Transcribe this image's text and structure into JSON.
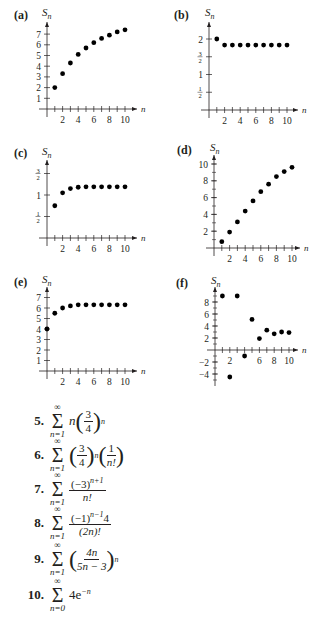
{
  "chart_data": [
    {
      "id": "a",
      "label": "(a)",
      "type": "scatter",
      "ylabel": "S_n",
      "xlabel": "n",
      "x": [
        1,
        2,
        3,
        4,
        5,
        6,
        7,
        8,
        9,
        10
      ],
      "values": [
        2,
        3.3,
        4.3,
        5.1,
        5.7,
        6.2,
        6.6,
        6.9,
        7.2,
        7.4
      ],
      "xticks": [
        "2",
        "4",
        "6",
        "8",
        "10"
      ],
      "yticks": [
        "1",
        "2",
        "3",
        "4",
        "5",
        "6",
        "7"
      ],
      "ylim": [
        0,
        7.8
      ],
      "xlim": [
        0,
        10.5
      ]
    },
    {
      "id": "b",
      "label": "(b)",
      "type": "scatter",
      "ylabel": "S_n",
      "xlabel": "n",
      "x": [
        1,
        2,
        3,
        4,
        5,
        6,
        7,
        8,
        9,
        10
      ],
      "values": [
        2,
        1.83,
        1.83,
        1.83,
        1.83,
        1.83,
        1.83,
        1.83,
        1.83,
        1.83
      ],
      "xticks": [
        "2",
        "4",
        "6",
        "8",
        "10"
      ],
      "yticks": [
        "1/2",
        "1",
        "3/2",
        "2"
      ],
      "ylim": [
        0,
        2.3
      ],
      "xlim": [
        0,
        10.5
      ]
    },
    {
      "id": "c",
      "label": "(c)",
      "type": "scatter",
      "ylabel": "S_n",
      "xlabel": "n",
      "x": [
        1,
        2,
        3,
        4,
        5,
        6,
        7,
        8,
        9,
        10
      ],
      "values": [
        0.75,
        1.05,
        1.15,
        1.18,
        1.19,
        1.19,
        1.19,
        1.19,
        1.19,
        1.19
      ],
      "xticks": [
        "2",
        "4",
        "6",
        "8",
        "10"
      ],
      "yticks": [
        "1/2",
        "1",
        "3/2"
      ],
      "ylim": [
        0,
        1.8
      ],
      "xlim": [
        0,
        10.5
      ]
    },
    {
      "id": "d",
      "label": "(d)",
      "type": "scatter",
      "ylabel": "S_n",
      "xlabel": "n",
      "x": [
        1,
        2,
        3,
        4,
        5,
        6,
        7,
        8,
        9,
        10
      ],
      "values": [
        0.75,
        1.9,
        3.1,
        4.4,
        5.6,
        6.7,
        7.6,
        8.5,
        9.1,
        9.6
      ],
      "xticks": [
        "2",
        "4",
        "6",
        "8",
        "10"
      ],
      "yticks": [
        "2",
        "4",
        "6",
        "8",
        "10"
      ],
      "ylim": [
        0,
        11
      ],
      "xlim": [
        0,
        10.5
      ]
    },
    {
      "id": "e",
      "label": "(e)",
      "type": "scatter",
      "ylabel": "S_n",
      "xlabel": "n",
      "x": [
        0,
        1,
        2,
        3,
        4,
        5,
        6,
        7,
        8,
        9,
        10
      ],
      "values": [
        4,
        5.5,
        6,
        6.2,
        6.3,
        6.3,
        6.3,
        6.3,
        6.3,
        6.3,
        6.3
      ],
      "xticks": [
        "2",
        "4",
        "6",
        "8",
        "10"
      ],
      "yticks": [
        "1",
        "2",
        "3",
        "4",
        "5",
        "6",
        "7"
      ],
      "ylim": [
        0,
        7.8
      ],
      "xlim": [
        0,
        10.5
      ]
    },
    {
      "id": "f",
      "label": "(f)",
      "type": "scatter",
      "ylabel": "S_n",
      "xlabel": "n",
      "x": [
        1,
        2,
        3,
        4,
        5,
        6,
        7,
        8,
        9,
        10
      ],
      "values": [
        9,
        -4.5,
        9,
        -1,
        5.1,
        1.9,
        3.3,
        2.7,
        3.0,
        2.9
      ],
      "xticks": [
        "2",
        "6",
        "8",
        "10"
      ],
      "yticks": [
        "-4",
        "-2",
        "2",
        "4",
        "6",
        "8"
      ],
      "ylim": [
        -5,
        10
      ],
      "xlim": [
        0,
        10.5
      ]
    }
  ],
  "exercises": [
    {
      "num": "5."
    },
    {
      "num": "6."
    },
    {
      "num": "7."
    },
    {
      "num": "8."
    },
    {
      "num": "9."
    },
    {
      "num": "10."
    }
  ],
  "formula_text": {
    "sum_top": "∞",
    "sum_bottom_1": "n=1",
    "sum_bottom_0": "n=0",
    "sigma": "Σ",
    "f5_n": "n",
    "f5_num": "3",
    "f5_den": "4",
    "f5_exp": "n",
    "f6_num1": "3",
    "f6_den1": "4",
    "f6_exp": "n",
    "f6_num2": "1",
    "f6_den2": "n!",
    "f7_num": "(−3)",
    "f7_exp": "n+1",
    "f7_den": "n!",
    "f8_num": "(−1)",
    "f8_exp": "n−1",
    "f8_num_tail": "4",
    "f8_den": "(2n)!",
    "f9_num": "4n",
    "f9_den": "5n − 3",
    "f9_exp": "n",
    "f10_term": "4e",
    "f10_exp": "−n"
  }
}
